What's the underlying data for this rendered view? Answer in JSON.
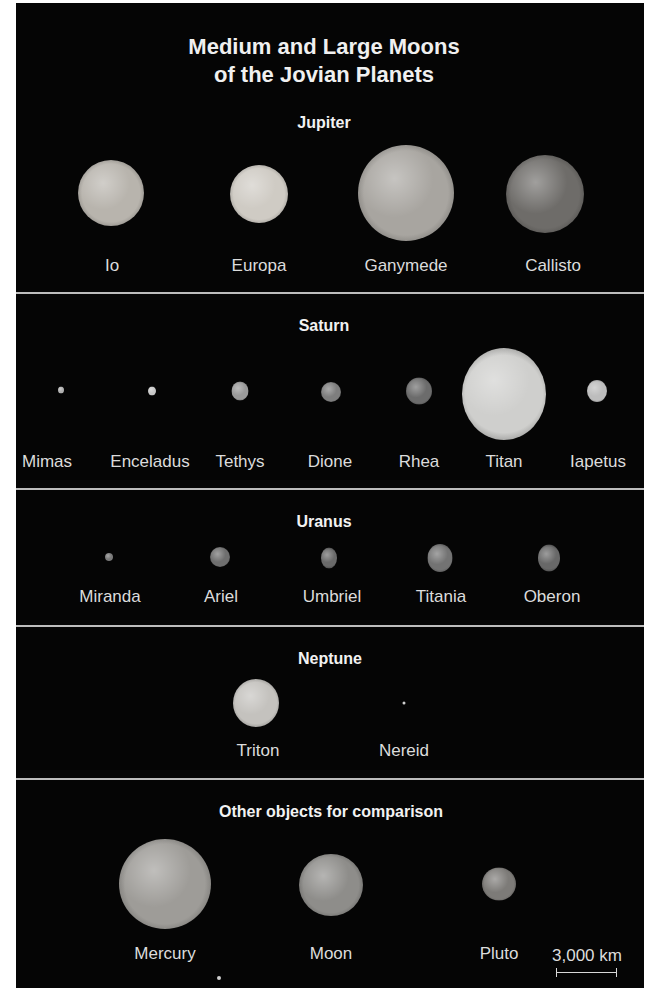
{
  "title": {
    "line1": "Medium and Large Moons",
    "line2": "of the Jovian Planets"
  },
  "sections": [
    {
      "heading": "Jupiter",
      "bodies": [
        {
          "name": "Io",
          "tone": "#b8b4ad"
        },
        {
          "name": "Europa",
          "tone": "#cfcbc4"
        },
        {
          "name": "Ganymede",
          "tone": "#a8a5a0"
        },
        {
          "name": "Callisto",
          "tone": "#6e6c69"
        }
      ]
    },
    {
      "heading": "Saturn",
      "bodies": [
        {
          "name": "Mimas",
          "tone": "#b0b0b0"
        },
        {
          "name": "Enceladus",
          "tone": "#c8c8c8"
        },
        {
          "name": "Tethys",
          "tone": "#9a9a9a"
        },
        {
          "name": "Dione",
          "tone": "#7e7e7e"
        },
        {
          "name": "Rhea",
          "tone": "#6c6c6c"
        },
        {
          "name": "Titan",
          "tone": "#cfcfcd"
        },
        {
          "name": "Iapetus",
          "tone": "#bdbdbd"
        }
      ]
    },
    {
      "heading": "Uranus",
      "bodies": [
        {
          "name": "Miranda",
          "tone": "#7a7a7a"
        },
        {
          "name": "Ariel",
          "tone": "#6f6f6f"
        },
        {
          "name": "Umbriel",
          "tone": "#6a6a6a"
        },
        {
          "name": "Titania",
          "tone": "#737373"
        },
        {
          "name": "Oberon",
          "tone": "#686868"
        }
      ]
    },
    {
      "heading": "Neptune",
      "bodies": [
        {
          "name": "Triton",
          "tone": "#c4c2be"
        },
        {
          "name": "Nereid",
          "tone": "#cfcfcf"
        }
      ]
    },
    {
      "heading": "Other objects for comparison",
      "bodies": [
        {
          "name": "Mercury",
          "tone": "#9e9c98"
        },
        {
          "name": "Moon",
          "tone": "#8e8d8a"
        },
        {
          "name": "Pluto",
          "tone": "#7d7b78"
        }
      ]
    }
  ],
  "scale": {
    "label": "3,000 km"
  },
  "colors": {
    "background": "#050505",
    "divider": "#bdbdbd",
    "text": "#e6e6e6"
  }
}
